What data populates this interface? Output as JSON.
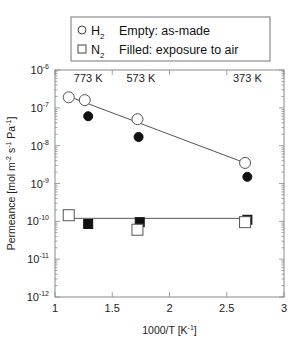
{
  "chart_data": {
    "type": "scatter",
    "title": "",
    "xlabel": "1000/T [K⁻¹]",
    "xlabel_main": "1000/T [K",
    "xlabel_sup": "-1",
    "xlabel_end": "]",
    "ylabel": "Permeance [mol m⁻² s⁻¹ Pa⁻¹]",
    "xlim": [
      1,
      3
    ],
    "ylim": [
      1e-12,
      1e-06
    ],
    "yscale": "log",
    "x_ticks": [
      "1",
      "1.5",
      "2",
      "2.5",
      "3"
    ],
    "y_ticks": [
      {
        "base": "10",
        "exp": "-6"
      },
      {
        "base": "10",
        "exp": "-7"
      },
      {
        "base": "10",
        "exp": "-8"
      },
      {
        "base": "10",
        "exp": "-9"
      },
      {
        "base": "10",
        "exp": "-10"
      },
      {
        "base": "10",
        "exp": "-11"
      },
      {
        "base": "10",
        "exp": "-12"
      }
    ],
    "temperature_labels": [
      {
        "text": "773 K",
        "x": 1.29
      },
      {
        "text": "573 K",
        "x": 1.75
      },
      {
        "text": "373 K",
        "x": 2.68
      }
    ],
    "legend": {
      "markers": [
        {
          "symbol": "open-circle",
          "gas": "H",
          "sub": "2",
          "desc": "Empty: as-made"
        },
        {
          "symbol": "open-square",
          "gas": "N",
          "sub": "2",
          "desc": "Filled: exposure to air"
        }
      ],
      "position": "top"
    },
    "series": [
      {
        "name": "H2 Empty: as-made",
        "marker": "open-circle",
        "points": [
          [
            1.12,
            1.9e-07
          ],
          [
            1.26,
            1.6e-07
          ],
          [
            1.72,
            5e-08
          ],
          [
            2.66,
            3.5e-09
          ]
        ]
      },
      {
        "name": "H2 Filled: exposure to air",
        "marker": "filled-circle",
        "points": [
          [
            1.29,
            6e-08
          ],
          [
            1.73,
            1.7e-08
          ],
          [
            2.68,
            1.5e-09
          ]
        ]
      },
      {
        "name": "N2 Empty: as-made",
        "marker": "open-square",
        "points": [
          [
            1.12,
            1.45e-10
          ],
          [
            1.72,
            6e-11
          ],
          [
            2.66,
            9.5e-11
          ]
        ]
      },
      {
        "name": "N2 Filled: exposure to air",
        "marker": "filled-square",
        "points": [
          [
            1.29,
            8.5e-11
          ],
          [
            1.74,
            9.5e-11
          ],
          [
            2.68,
            1.1e-10
          ]
        ]
      }
    ],
    "fit_lines": [
      {
        "name": "H2 trend",
        "points": [
          [
            1.12,
            2e-07
          ],
          [
            2.66,
            3.5e-09
          ]
        ]
      },
      {
        "name": "N2 trend",
        "points": [
          [
            1.12,
            1.2e-10
          ],
          [
            2.68,
            1.2e-10
          ]
        ]
      }
    ],
    "grid": false
  }
}
